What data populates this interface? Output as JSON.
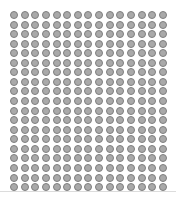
{
  "grid": {
    "rows": 19,
    "cols": 15,
    "origin_x": 14,
    "origin_y": 15,
    "step_x": 10.64,
    "step_y": 9.56,
    "dot_diameter": 8,
    "dot_fill": "#a9a9a9",
    "dot_stroke": "#7f7f7f"
  },
  "baseline": {
    "y": 191,
    "color": "#dcdcdc"
  }
}
